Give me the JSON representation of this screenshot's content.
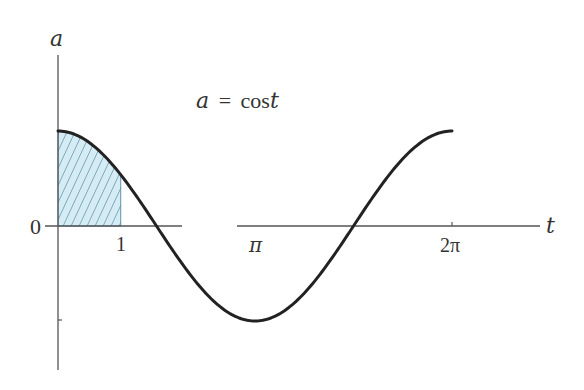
{
  "chart_data": {
    "type": "line",
    "title": "",
    "annotation": "a = cost",
    "annotation_parts": {
      "lhs": "a",
      "eq": "=",
      "rhs": "cos",
      "var": "t"
    },
    "xlabel": "t",
    "ylabel": "a",
    "x_ticks": [
      {
        "value": 1,
        "label": "1"
      },
      {
        "value": 3.14159,
        "label": "π"
      },
      {
        "value": 6.28319,
        "label": "2π"
      }
    ],
    "y_ticks": [
      {
        "value": 0,
        "label": "0"
      },
      {
        "value": -1,
        "label": ""
      }
    ],
    "xlim": [
      0,
      6.9
    ],
    "ylim": [
      -1.5,
      1.0
    ],
    "series": [
      {
        "name": "a = cos t",
        "function": "cos(t)",
        "x": [
          0,
          0.5,
          1,
          1.5708,
          2,
          2.5,
          3.14159,
          3.5,
          4,
          4.7124,
          5,
          5.5,
          6.28319
        ],
        "values": [
          1,
          0.878,
          0.54,
          0,
          -0.416,
          -0.801,
          -1,
          -0.936,
          -0.654,
          0,
          0.284,
          0.709,
          1
        ],
        "color": "#222222"
      }
    ],
    "shaded_region": {
      "from": 0,
      "to": 1,
      "description": "area under cos t from t=0 to t=1, hatched",
      "fill_color": "#d6ecf5",
      "hatch_color": "#2f6f8a"
    },
    "grid": false,
    "legend": null
  }
}
